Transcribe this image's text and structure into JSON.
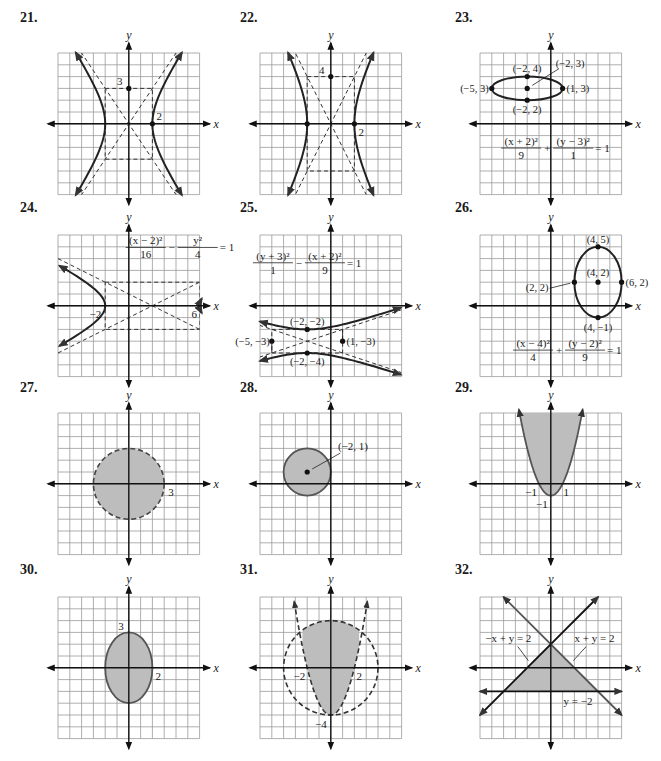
{
  "page": {
    "grid": {
      "cells": 12,
      "cell_px": 11.8,
      "grid_color": "#9a9a9a",
      "curve_color": "#222222",
      "shade_color": "#bdbdbd",
      "axis_color": "#111111"
    }
  },
  "chart_data": [
    {
      "id": "21",
      "label": "21.",
      "type": "line",
      "title": "Hyperbola",
      "xlabel": "x",
      "ylabel": "y",
      "xlim": [
        -6,
        6
      ],
      "ylim": [
        -6,
        6
      ],
      "grid": true,
      "curve": {
        "kind": "hyperbola-horizontal",
        "h": 0,
        "k": 0,
        "a": 2,
        "b": 3
      },
      "asymptotes": "dashed",
      "fundamental_box": "dashed",
      "annotations": [
        {
          "text": "3",
          "x": 0,
          "y": 3
        },
        {
          "text": "2",
          "x": 2,
          "y": 0
        }
      ]
    },
    {
      "id": "22",
      "label": "22.",
      "type": "line",
      "title": "Hyperbola",
      "xlabel": "x",
      "ylabel": "y",
      "xlim": [
        -6,
        6
      ],
      "ylim": [
        -6,
        6
      ],
      "grid": true,
      "curve": {
        "kind": "hyperbola-horizontal",
        "h": 0,
        "k": 0,
        "a": 2,
        "b": 4
      },
      "asymptotes": "dashed",
      "fundamental_box": "dashed",
      "annotations": [
        {
          "text": "4",
          "x": 0,
          "y": 4
        },
        {
          "text": "2",
          "x": 2,
          "y": 0
        }
      ]
    },
    {
      "id": "23",
      "label": "23.",
      "type": "line",
      "title": "Ellipse",
      "xlabel": "x",
      "ylabel": "y",
      "xlim": [
        -6,
        6
      ],
      "ylim": [
        -6,
        6
      ],
      "grid": true,
      "curve": {
        "kind": "ellipse",
        "h": -2,
        "k": 3,
        "a": 3,
        "b": 1
      },
      "equation": {
        "num1": "(x + 2)²",
        "den1": "9",
        "op": "+",
        "num2": "(y − 3)²",
        "den2": "1",
        "rhs": "= 1"
      },
      "points": [
        {
          "text": "(−2, 4)",
          "x": -2,
          "y": 4
        },
        {
          "text": "(−2, 3)",
          "x": -2,
          "y": 3
        },
        {
          "text": "(−5, 3)",
          "x": -5,
          "y": 3
        },
        {
          "text": "(1, 3)",
          "x": 1,
          "y": 3
        },
        {
          "text": "(−2, 2)",
          "x": -2,
          "y": 2
        }
      ]
    },
    {
      "id": "24",
      "label": "24.",
      "type": "line",
      "title": "Hyperbola",
      "xlabel": "x",
      "ylabel": "y",
      "xlim": [
        -6,
        6
      ],
      "ylim": [
        -6,
        6
      ],
      "grid": true,
      "curve": {
        "kind": "hyperbola-horizontal",
        "h": 2,
        "k": 0,
        "a": 4,
        "b": 2
      },
      "equation": {
        "num1": "(x − 2)²",
        "den1": "16",
        "op": "−",
        "num2": "y²",
        "den2": "4",
        "rhs": "= 1"
      },
      "annotations": [
        {
          "text": "−2",
          "x": -2,
          "y": 0
        },
        {
          "text": "6",
          "x": 6,
          "y": 0
        }
      ]
    },
    {
      "id": "25",
      "label": "25.",
      "type": "line",
      "title": "Hyperbola",
      "xlabel": "x",
      "ylabel": "y",
      "xlim": [
        -6,
        6
      ],
      "ylim": [
        -6,
        6
      ],
      "grid": true,
      "curve": {
        "kind": "hyperbola-vertical",
        "h": -2,
        "k": -3,
        "a": 1,
        "b": 3
      },
      "equation": {
        "num1": "(y + 3)²",
        "den1": "1",
        "op": "−",
        "num2": "(x + 2)²",
        "den2": "9",
        "rhs": "= 1"
      },
      "points": [
        {
          "text": "(−2, −2)",
          "x": -2,
          "y": -2
        },
        {
          "text": "(−5, −3)",
          "x": -5,
          "y": -3
        },
        {
          "text": "(1, −3)",
          "x": 1,
          "y": -3
        },
        {
          "text": "(−2, −4)",
          "x": -2,
          "y": -4
        }
      ]
    },
    {
      "id": "26",
      "label": "26.",
      "type": "line",
      "title": "Ellipse",
      "xlabel": "x",
      "ylabel": "y",
      "xlim": [
        -6,
        6
      ],
      "ylim": [
        -6,
        6
      ],
      "grid": true,
      "curve": {
        "kind": "ellipse",
        "h": 4,
        "k": 2,
        "a": 2,
        "b": 3
      },
      "equation": {
        "num1": "(x − 4)²",
        "den1": "4",
        "op": "+",
        "num2": "(y − 2)²",
        "den2": "9",
        "rhs": "= 1"
      },
      "points": [
        {
          "text": "(4, 5)",
          "x": 4,
          "y": 5
        },
        {
          "text": "(4, 2)",
          "x": 4,
          "y": 2
        },
        {
          "text": "(2, 2)",
          "x": 2,
          "y": 2
        },
        {
          "text": "(6, 2)",
          "x": 6,
          "y": 2
        },
        {
          "text": "(4, −1)",
          "x": 4,
          "y": -1
        }
      ]
    },
    {
      "id": "27",
      "label": "27.",
      "type": "area",
      "title": "Circle region (dashed)",
      "xlabel": "x",
      "ylabel": "y",
      "xlim": [
        -6,
        6
      ],
      "ylim": [
        -6,
        6
      ],
      "grid": true,
      "curve": {
        "kind": "circle",
        "h": 0,
        "k": 0,
        "r": 3,
        "dashed": true,
        "shaded": "inside"
      },
      "annotations": [
        {
          "text": "3",
          "x": 3,
          "y": 0
        }
      ]
    },
    {
      "id": "28",
      "label": "28.",
      "type": "area",
      "title": "Circle region (solid)",
      "xlabel": "x",
      "ylabel": "y",
      "xlim": [
        -6,
        6
      ],
      "ylim": [
        -6,
        6
      ],
      "grid": true,
      "curve": {
        "kind": "circle",
        "h": -2,
        "k": 1,
        "r": 2,
        "dashed": false,
        "shaded": "inside"
      },
      "points": [
        {
          "text": "(−2, 1)",
          "x": -2,
          "y": 1
        }
      ]
    },
    {
      "id": "29",
      "label": "29.",
      "type": "area",
      "title": "Parabola region",
      "xlabel": "x",
      "ylabel": "y",
      "xlim": [
        -6,
        6
      ],
      "ylim": [
        -6,
        6
      ],
      "grid": true,
      "curve": {
        "kind": "parabola",
        "equation": "y = x² − 1",
        "dashed": false,
        "shaded": "above"
      },
      "annotations": [
        {
          "text": "−1",
          "x": -1,
          "y": 0
        },
        {
          "text": "1",
          "x": 1,
          "y": 0
        },
        {
          "text": "−1",
          "x": 0,
          "y": -1
        }
      ]
    },
    {
      "id": "30",
      "label": "30.",
      "type": "area",
      "title": "Ellipse region",
      "xlabel": "x",
      "ylabel": "y",
      "xlim": [
        -6,
        6
      ],
      "ylim": [
        -6,
        6
      ],
      "grid": true,
      "curve": {
        "kind": "ellipse",
        "h": 0,
        "k": 0,
        "a": 2,
        "b": 3,
        "dashed": false,
        "shaded": "inside"
      },
      "annotations": [
        {
          "text": "3",
          "x": 0,
          "y": 3
        },
        {
          "text": "2",
          "x": 2,
          "y": 0
        }
      ]
    },
    {
      "id": "31",
      "label": "31.",
      "type": "area",
      "title": "Circle ∩ parabola region",
      "xlabel": "x",
      "ylabel": "y",
      "xlim": [
        -6,
        6
      ],
      "ylim": [
        -6,
        6
      ],
      "grid": true,
      "curves": [
        {
          "kind": "circle",
          "h": 0,
          "k": 0,
          "r": 4,
          "dashed": true
        },
        {
          "kind": "parabola",
          "equation": "y = x² − 4",
          "dashed": true
        }
      ],
      "shaded": "inside circle and above parabola",
      "annotations": [
        {
          "text": "−2",
          "x": -2,
          "y": 0
        },
        {
          "text": "2",
          "x": 2,
          "y": 0
        },
        {
          "text": "−4",
          "x": 0,
          "y": -4
        }
      ]
    },
    {
      "id": "32",
      "label": "32.",
      "type": "area",
      "title": "Triangle region of linear inequalities",
      "xlabel": "x",
      "ylabel": "y",
      "xlim": [
        -6,
        6
      ],
      "ylim": [
        -6,
        6
      ],
      "grid": true,
      "lines": [
        {
          "label": "−x + y = 2",
          "slope": 1,
          "intercept": 2
        },
        {
          "label": "x + y = 2",
          "slope": -1,
          "intercept": 2
        },
        {
          "label": "y = −2",
          "slope": 0,
          "intercept": -2
        }
      ],
      "vertices": [
        [
          0,
          2
        ],
        [
          -4,
          -2
        ],
        [
          4,
          -2
        ]
      ]
    }
  ]
}
